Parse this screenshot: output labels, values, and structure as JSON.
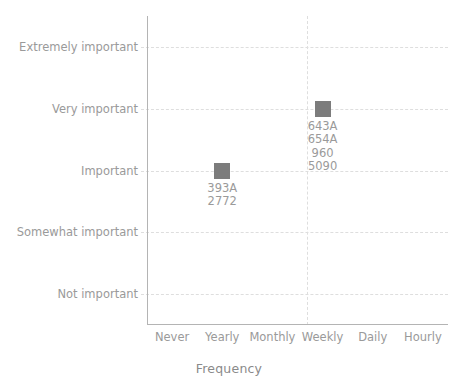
{
  "chart_data": {
    "type": "scatter",
    "title": "",
    "xlabel": "Frequency",
    "ylabel": "Importance",
    "grid": true,
    "legend": false,
    "x_categories": [
      "Never",
      "Yearly",
      "Monthly",
      "Weekly",
      "Daily",
      "Hourly"
    ],
    "y_categories": [
      "Not important",
      "Somewhat important",
      "Important",
      "Very important",
      "Extremely important"
    ],
    "marker_color": "#7c7c7c",
    "gridline_color": "#dedede",
    "axis_color": "#b4b4b4",
    "text_color": "#9a9a9a",
    "points": [
      {
        "x": "Yearly",
        "y": "Important",
        "labels": [
          "393A",
          "2772"
        ]
      },
      {
        "x": "Weekly",
        "y": "Very important",
        "labels": [
          "643A",
          "654A",
          "960",
          "5090"
        ]
      }
    ]
  }
}
